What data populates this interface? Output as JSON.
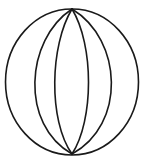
{
  "diagram": {
    "type": "line-drawing",
    "stroke_color": "#1a1a1a",
    "background": "#ffffff",
    "top_point": [
      72,
      8
    ],
    "bottom_point": [
      72,
      154
    ],
    "outer_circle": {
      "cx": 72,
      "cy": 81,
      "rx": 67,
      "ry": 73
    },
    "meridians": [
      {
        "side": "left",
        "mid_x": 31
      },
      {
        "side": "left",
        "mid_x": 54
      },
      {
        "side": "right",
        "mid_x": 89
      },
      {
        "side": "right",
        "mid_x": 115
      }
    ]
  }
}
